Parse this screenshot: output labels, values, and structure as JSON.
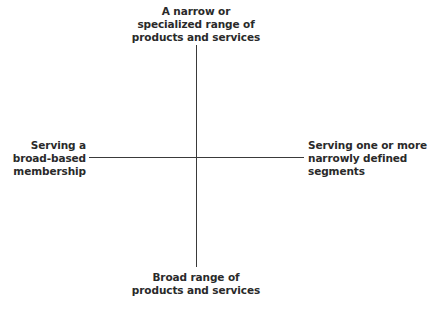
{
  "diagram": {
    "type": "quadrant-axes",
    "colors": {
      "text": "#2a2a2a",
      "axis": "#3a3a3a",
      "background": "#ffffff"
    },
    "vertical_axis": {
      "top_label": {
        "lines": [
          "A narrow or",
          "specialized range of",
          "products and services"
        ]
      },
      "bottom_label": {
        "lines": [
          "Broad range of",
          "products and services"
        ]
      }
    },
    "horizontal_axis": {
      "left_label": {
        "lines": [
          "Serving a",
          "broad-based",
          "membership"
        ]
      },
      "right_label": {
        "lines": [
          "Serving one or more",
          "narrowly defined",
          "segments"
        ]
      }
    }
  }
}
